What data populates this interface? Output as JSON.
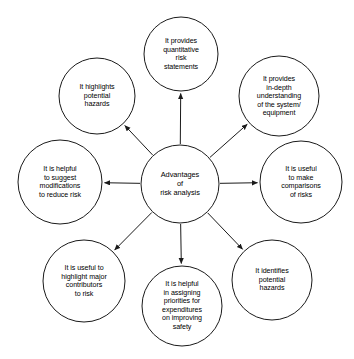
{
  "diagram": {
    "type": "hub-and-spoke mind map",
    "center": {
      "id": "center",
      "label": "Advantages\nof\nrisk analysis",
      "cx": 180,
      "cy": 184,
      "r": 39
    },
    "nodes": [
      {
        "id": "quantitative-risk-statements",
        "label": "It provides\nquantitative\nrisk\nstatements",
        "cx": 181,
        "cy": 54,
        "r": 37,
        "angle": -90
      },
      {
        "id": "in-depth-understanding",
        "label": "It provides\nin-depth\nunderstanding\nof the system/\nequipment",
        "cx": 279,
        "cy": 96,
        "r": 40,
        "angle": -45
      },
      {
        "id": "comparisons-of-risks",
        "label": "It is useful\nto make\ncomparisons\nof risks",
        "cx": 301,
        "cy": 182,
        "r": 41,
        "angle": 0
      },
      {
        "id": "identifies-potential-hazards",
        "label": "It identifies\npotential\nhazards",
        "cx": 272,
        "cy": 280,
        "r": 40,
        "angle": 45
      },
      {
        "id": "assigning-priorities",
        "label": "It is helpful\nin assigning\npriorities for\nexpenditures\non improving\nsafety",
        "cx": 182,
        "cy": 306,
        "r": 40,
        "angle": 90
      },
      {
        "id": "major-contributors",
        "label": "It is useful to\nhighlight major\ncontributors\nto risk",
        "cx": 84,
        "cy": 281,
        "r": 41,
        "angle": 135
      },
      {
        "id": "suggest-modifications",
        "label": "It is helpful\nto suggest\nmodifications\nto reduce risk",
        "cx": 60,
        "cy": 182,
        "r": 42,
        "angle": 180
      },
      {
        "id": "highlights-potential-hazards",
        "label": "It highlights\npotential\nhazards",
        "cx": 97,
        "cy": 96,
        "r": 38,
        "angle": -135
      }
    ],
    "colors": {
      "stroke": "#1a1a1a",
      "fill": "#ffffff",
      "text": "#000000",
      "background": "#ffffff"
    }
  }
}
